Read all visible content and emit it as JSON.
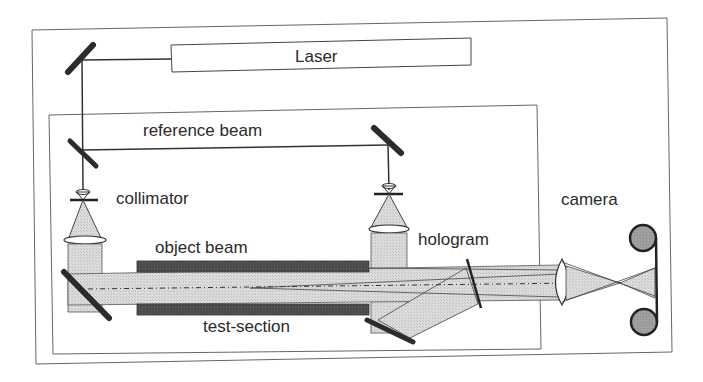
{
  "diagram": {
    "type": "holographic-interferometry-setup",
    "labels": {
      "laser": "Laser",
      "reference_beam": "reference beam",
      "collimator": "collimator",
      "object_beam": "object beam",
      "test_section": "test-section",
      "hologram": "hologram",
      "camera": "camera"
    },
    "components": [
      {
        "id": "laser",
        "label": "Laser"
      },
      {
        "id": "mirror-top-left",
        "label": ""
      },
      {
        "id": "beam-splitter",
        "label": ""
      },
      {
        "id": "mirror-reference",
        "label": ""
      },
      {
        "id": "collimator-object",
        "label": "collimator"
      },
      {
        "id": "collimator-reference",
        "label": ""
      },
      {
        "id": "mirror-object",
        "label": ""
      },
      {
        "id": "test-section",
        "label": "test-section"
      },
      {
        "id": "mirror-bottom",
        "label": ""
      },
      {
        "id": "hologram",
        "label": "hologram"
      },
      {
        "id": "camera-lens",
        "label": ""
      },
      {
        "id": "camera",
        "label": "camera"
      }
    ],
    "colors": {
      "line": "#3a3a3a",
      "mirror": "#2b2b2b",
      "beam_fill": "#d6d6d6",
      "test_section_fill": "#4a4a4a",
      "camera_reel": "#9a9a9a",
      "frame": "#555555",
      "background": "#ffffff"
    }
  }
}
